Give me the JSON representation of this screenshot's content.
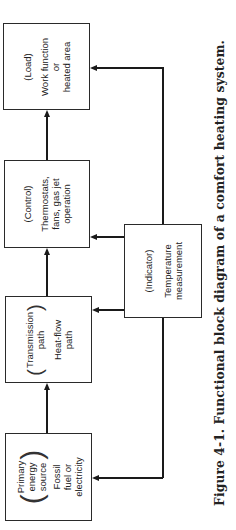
{
  "orientation": "rotated-90-ccw",
  "blocks": {
    "load": {
      "role": "(Load)",
      "lines": [
        "Work function",
        "or",
        "heated area"
      ]
    },
    "control": {
      "role": "(Control)",
      "lines": [
        "Thermostats,",
        "fans, gas jet",
        "operation"
      ]
    },
    "transmission": {
      "role_lines": [
        "Transmission",
        "path"
      ],
      "lines": [
        "Heat-flow",
        "path"
      ]
    },
    "primary": {
      "role_lines": [
        "Primary",
        "energy",
        "source"
      ],
      "lines": [
        "Fossil",
        "fuel or",
        "electricity"
      ]
    },
    "indicator": {
      "role": "(Indicator)",
      "lines": [
        "Temperature",
        "measurement"
      ]
    }
  },
  "connections": [
    {
      "from": "primary",
      "to": "transmission"
    },
    {
      "from": "transmission",
      "to": "control"
    },
    {
      "from": "control",
      "to": "load"
    },
    {
      "from": "indicator",
      "to": "control"
    },
    {
      "from": "indicator",
      "to": "transmission"
    },
    {
      "from": "indicator",
      "to": "load"
    },
    {
      "from": "indicator",
      "to": "primary"
    }
  ],
  "caption": "Figure 4-1. Functional block diagram of a comfort heating system."
}
